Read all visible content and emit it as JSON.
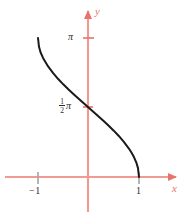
{
  "figure": {
    "kind": "cartesian-plot",
    "axis_color": "#e8736a",
    "curve_color": "#1a1a1a",
    "tick_text_color": "#2b2b2b",
    "background": "#ffffff"
  },
  "axes": {
    "x_axis_label": "x",
    "y_axis_label": "y",
    "x_ticks": [
      {
        "label": "−1",
        "value": -1
      },
      {
        "label": "1",
        "value": 1
      }
    ],
    "y_ticks": [
      {
        "label": "π",
        "value": 3.14159
      },
      {
        "label": "½π",
        "numerator": "1",
        "denominator": "2",
        "symbol": "π",
        "value": 1.5708
      }
    ]
  },
  "chart_data": {
    "type": "line",
    "title": "",
    "subtitle": "",
    "xlabel": "x",
    "ylabel": "y",
    "xlim": [
      -1.45,
      1.45
    ],
    "ylim": [
      -0.55,
      3.75
    ],
    "grid": false,
    "legend": "none",
    "series": [
      {
        "name": "y = arccos(x)",
        "x": [
          -1.0,
          -0.98,
          -0.95,
          -0.9,
          -0.85,
          -0.8,
          -0.7,
          -0.6,
          -0.5,
          -0.4,
          -0.3,
          -0.2,
          -0.1,
          0.0,
          0.1,
          0.2,
          0.3,
          0.4,
          0.5,
          0.6,
          0.7,
          0.8,
          0.85,
          0.9,
          0.95,
          0.98,
          1.0
        ],
        "y": [
          3.1416,
          2.9416,
          2.8198,
          2.6906,
          2.5913,
          2.4981,
          2.3462,
          2.2143,
          2.0944,
          1.9823,
          1.8755,
          1.7722,
          1.671,
          1.5708,
          1.4706,
          1.3694,
          1.2661,
          1.1593,
          1.0472,
          0.9273,
          0.7954,
          0.6435,
          0.5548,
          0.451,
          0.3176,
          0.2003,
          0.0
        ]
      }
    ],
    "annotations": [
      {
        "text": "π",
        "x": -0.22,
        "y": 3.14159
      },
      {
        "text": "½π",
        "x": -0.33,
        "y": 1.5708
      },
      {
        "text": "−1",
        "x": -1.0,
        "y": -0.22
      },
      {
        "text": "1",
        "x": 1.0,
        "y": -0.22
      }
    ]
  }
}
